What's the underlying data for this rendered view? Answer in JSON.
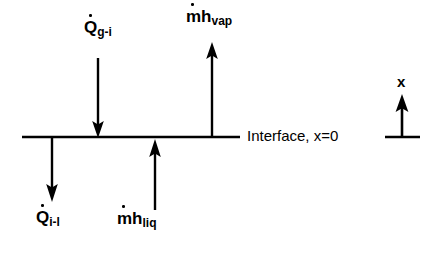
{
  "figure": {
    "kind": "interface-energy-balance-diagram",
    "background_color": "#ffffff",
    "stroke_color": "#000000"
  },
  "interface": {
    "label": "Interface, x=0",
    "line": {
      "x1": 22,
      "x2": 240,
      "y": 137
    }
  },
  "axis_indicator": {
    "label": "x",
    "direction": "up",
    "baseline": {
      "x1": 385,
      "x2": 420,
      "y": 137
    },
    "arrow": {
      "x": 402,
      "y_tail": 137,
      "y_head": 95
    }
  },
  "flux_arrows": [
    {
      "name": "gas-to-interface-heat",
      "base": "Q",
      "dot": true,
      "subscript": "g-i",
      "direction": "down",
      "label_text": "Q̇ g-i",
      "shaft": {
        "x": 98,
        "y_tail": 58,
        "y_head": 135
      }
    },
    {
      "name": "vapor-enthalpy-flux",
      "base": "mh",
      "dot": true,
      "subscript": "vap",
      "direction": "up",
      "label_text": "ṁh vap",
      "shaft": {
        "x": 212,
        "y_tail": 137,
        "y_head": 43
      }
    },
    {
      "name": "liquid-enthalpy-flux",
      "base": "mh",
      "dot": true,
      "subscript": "liq",
      "direction": "up",
      "label_text": "ṁh liq",
      "shaft": {
        "x": 155,
        "y_tail": 210,
        "y_head": 140
      }
    },
    {
      "name": "interface-to-liquid-heat",
      "base": "Q",
      "dot": true,
      "subscript": "i-l",
      "direction": "down",
      "label_text": "Q̇ i-l",
      "shaft": {
        "x": 52,
        "y_tail": 137,
        "y_head": 201
      }
    }
  ],
  "labels": {
    "q_gi_base": "Q",
    "q_gi_sub": "g-i",
    "mh_vap_base": "mh",
    "mh_vap_sub": "vap",
    "q_il_base": "Q",
    "q_il_sub": "i-l",
    "mh_liq_base": "mh",
    "mh_liq_sub": "liq",
    "interface": "Interface, x=0",
    "axis_x": "x"
  }
}
